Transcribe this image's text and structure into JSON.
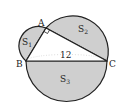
{
  "diagram": {
    "points": {
      "A": "A",
      "B": "B",
      "C": "C"
    },
    "regions": {
      "s1": "S",
      "s1_sub": "1",
      "s2": "S",
      "s2_sub": "2",
      "s3": "S",
      "s3_sub": "3"
    },
    "length_label": "12",
    "colors": {
      "fill": "#cfcfcf",
      "stroke": "#222222",
      "dotted": "#888888"
    }
  }
}
